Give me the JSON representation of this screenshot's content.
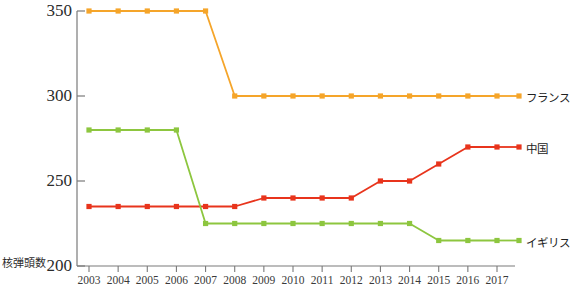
{
  "chart_data": {
    "type": "line",
    "title": "",
    "xlabel": "",
    "ylabel": "核弾頭数",
    "categories": [
      "2003",
      "2004",
      "2005",
      "2006",
      "2007",
      "2008",
      "2009",
      "2010",
      "2011",
      "2012",
      "2013",
      "2014",
      "2015",
      "2016",
      "2017"
    ],
    "x": [
      2003,
      2004,
      2005,
      2006,
      2007,
      2008,
      2009,
      2010,
      2011,
      2012,
      2013,
      2014,
      2015,
      2016,
      2017
    ],
    "xlim": [
      2003,
      2017
    ],
    "ylim": [
      200,
      350
    ],
    "yticks": [
      200,
      250,
      300,
      350
    ],
    "grid": false,
    "legend_position": "right",
    "series": [
      {
        "name": "フランス",
        "color": "#F5A52A",
        "values": [
          350,
          350,
          350,
          350,
          350,
          300,
          300,
          300,
          300,
          300,
          300,
          300,
          300,
          300,
          300
        ]
      },
      {
        "name": "中国",
        "color": "#E8341C",
        "values": [
          235,
          235,
          235,
          235,
          235,
          235,
          240,
          240,
          240,
          240,
          250,
          250,
          260,
          270,
          270
        ]
      },
      {
        "name": "イギリス",
        "color": "#8DC63F",
        "values": [
          280,
          280,
          280,
          280,
          225,
          225,
          225,
          225,
          225,
          225,
          225,
          225,
          215,
          215,
          215
        ]
      }
    ]
  },
  "axis": {
    "y_tick_labels": [
      "350",
      "300",
      "250",
      "200"
    ],
    "y_axis_title": "核弾頭数",
    "x_tick_labels": [
      "2003",
      "2004",
      "2005",
      "2006",
      "2007",
      "2008",
      "2009",
      "2010",
      "2011",
      "2012",
      "2013",
      "2014",
      "2015",
      "2016",
      "2017"
    ]
  },
  "legend": {
    "items": [
      {
        "label": "フランス",
        "color": "#F5A52A"
      },
      {
        "label": "中国",
        "color": "#E8341C"
      },
      {
        "label": "イギリス",
        "color": "#8DC63F"
      }
    ]
  },
  "colors": {
    "axis": "#7a7a7a",
    "text": "#2b2b2b",
    "background": "#ffffff",
    "france": "#F5A52A",
    "china": "#E8341C",
    "uk": "#8DC63F"
  }
}
